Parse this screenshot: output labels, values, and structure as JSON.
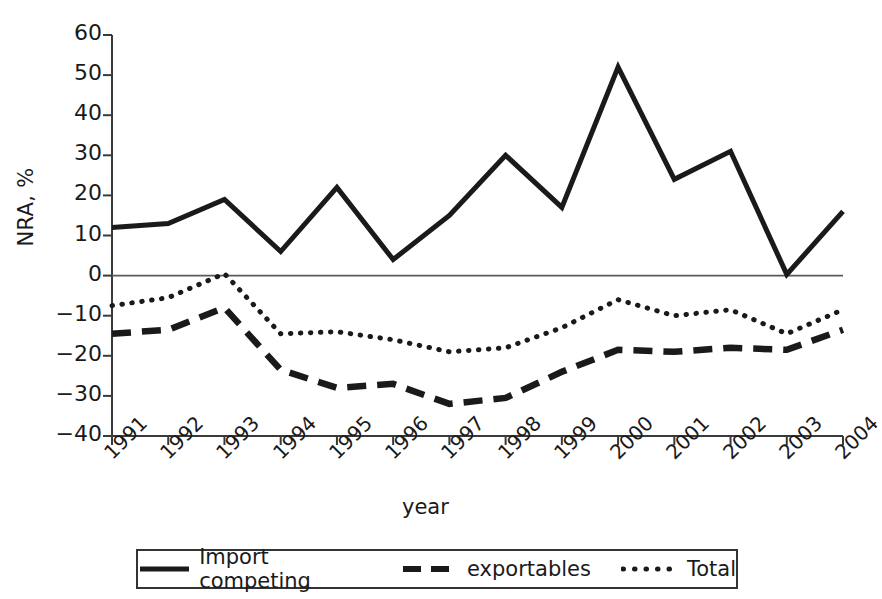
{
  "chart_data": {
    "type": "line",
    "title": "",
    "xlabel": "year",
    "ylabel": "NRA, %",
    "x": [
      1991,
      1992,
      1993,
      1994,
      1995,
      1996,
      1997,
      1998,
      1999,
      2000,
      2001,
      2002,
      2003,
      2004
    ],
    "xtick_labels": [
      "1991",
      "1992",
      "1993",
      "1994",
      "1995",
      "1996",
      "1997",
      "1998",
      "1999",
      "2000",
      "2001",
      "2002",
      "2003",
      "2004"
    ],
    "ytick_labels": [
      "60",
      "50",
      "40",
      "30",
      "20",
      "10",
      "0",
      "−10",
      "−20",
      "−30",
      "−40"
    ],
    "yticks": [
      60,
      50,
      40,
      30,
      20,
      10,
      0,
      -10,
      -20,
      -30,
      -40
    ],
    "ylim": [
      -40,
      60
    ],
    "xlim": [
      1991,
      2004
    ],
    "grid": false,
    "zero_line": true,
    "legend_position": "bottom-center",
    "series": [
      {
        "name": "Import competing",
        "style": "solid",
        "values": [
          12,
          13,
          19,
          6,
          22,
          4,
          15,
          30,
          17,
          52,
          24,
          31,
          0.3,
          16
        ]
      },
      {
        "name": "exportables",
        "style": "dashed",
        "values": [
          -14.5,
          -13.5,
          -8,
          -23.5,
          -28,
          -27,
          -32,
          -30.5,
          -24,
          -18.5,
          -19,
          -18,
          -18.5,
          -13.5
        ]
      },
      {
        "name": "Total",
        "style": "dotted",
        "values": [
          -7.5,
          -5.5,
          0.5,
          -14.5,
          -14,
          -16,
          -19,
          -18,
          -13,
          -6,
          -10,
          -8.5,
          -14.5,
          -8.5
        ]
      }
    ]
  },
  "axis": {
    "y_label": "NRA, %",
    "x_label": "year"
  },
  "legend": {
    "items": [
      {
        "label": "Import competing",
        "style": "solid"
      },
      {
        "label": "exportables",
        "style": "dashed"
      },
      {
        "label": "Total",
        "style": "dotted"
      }
    ]
  }
}
